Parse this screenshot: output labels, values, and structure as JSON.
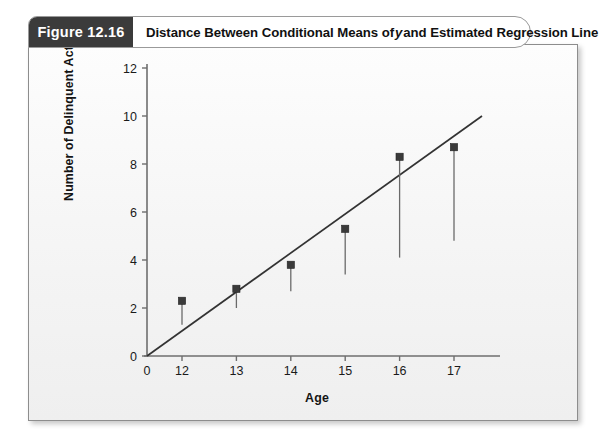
{
  "figure": {
    "tag_label": "Figure  12.16",
    "title_prefix": "Distance Between Conditional Means of",
    "title_italic": "y",
    "title_suffix": "and Estimated Regression Line"
  },
  "chart_data": {
    "type": "scatter",
    "title": "Distance Between Conditional Means of y and Estimated Regression Line",
    "xlabel": "Age",
    "ylabel": "Number of Delinquent Acts",
    "xlim": [
      0,
      17.9
    ],
    "ylim": [
      0,
      12
    ],
    "grid": false,
    "legend": "none",
    "x_ticks": [
      "0",
      "12",
      "13",
      "14",
      "15",
      "16",
      "17"
    ],
    "x_tick_values": [
      0,
      12,
      13,
      14,
      15,
      16,
      17
    ],
    "y_ticks": [
      "0",
      "2",
      "4",
      "6",
      "8",
      "10",
      "12"
    ],
    "y_tick_values": [
      0,
      2,
      4,
      6,
      8,
      10,
      12
    ],
    "x_axis_break_after": 0,
    "series": [
      {
        "name": "Conditional means of y",
        "marker": "square",
        "color": "#3a3a3a",
        "x": [
          12,
          13,
          14,
          15,
          16,
          17
        ],
        "values": [
          2.3,
          2.8,
          3.8,
          5.3,
          8.3,
          8.7
        ]
      },
      {
        "name": "Estimated regression line",
        "type": "line",
        "color": "#333333",
        "x": [
          0,
          17.6
        ],
        "values": [
          0,
          10.0
        ],
        "fitted_at_x": [
          1.3,
          2.0,
          2.7,
          3.4,
          4.1,
          4.8
        ]
      }
    ],
    "residual_drops": [
      {
        "x": 12,
        "from": 2.3,
        "to": 1.3
      },
      {
        "x": 13,
        "from": 2.8,
        "to": 2.0
      },
      {
        "x": 14,
        "from": 3.8,
        "to": 2.7
      },
      {
        "x": 15,
        "from": 5.3,
        "to": 3.4
      },
      {
        "x": 16,
        "from": 8.3,
        "to": 4.1
      },
      {
        "x": 17,
        "from": 8.7,
        "to": 4.8
      }
    ],
    "colors": {
      "marker": "#3a3a3a",
      "line": "#333333",
      "axis": "#6e6e6e",
      "text": "#141414",
      "panel_background": "#f4f4f4"
    }
  }
}
